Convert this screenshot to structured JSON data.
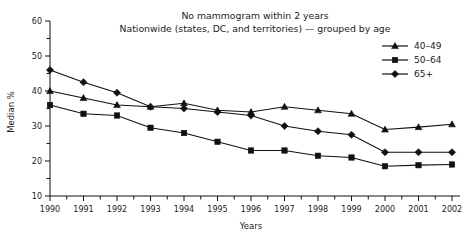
{
  "chart_data": {
    "type": "line",
    "title": "No mammogram within 2 years",
    "subtitle": "Nationwide (states, DC, and territories) — grouped by age",
    "xlabel": "Years",
    "ylabel": "Median %",
    "x": [
      1990,
      1991,
      1992,
      1993,
      1994,
      1995,
      1996,
      1997,
      1998,
      1999,
      2000,
      2001,
      2002
    ],
    "categories": [
      "1990",
      "1991",
      "1992",
      "1993",
      "1994",
      "1995",
      "1996",
      "1997",
      "1998",
      "1999",
      "2000",
      "2001",
      "2002"
    ],
    "xlim": [
      1990,
      2002
    ],
    "ylim": [
      10,
      60
    ],
    "ytick_labels": [
      "10",
      "20",
      "30",
      "40",
      "50",
      "60"
    ],
    "ytick_values": [
      10,
      20,
      30,
      40,
      50,
      60
    ],
    "yminor_values": [
      15,
      25,
      35,
      45,
      55
    ],
    "grid": false,
    "legend_position": "top-right",
    "series": [
      {
        "name": "40–49",
        "marker": "triangle",
        "color": "#111111",
        "values": [
          40.0,
          38.0,
          36.0,
          35.5,
          36.5,
          34.5,
          34.0,
          35.5,
          34.5,
          33.5,
          29.0,
          29.7,
          30.5
        ]
      },
      {
        "name": "50–64",
        "marker": "square",
        "color": "#111111",
        "values": [
          36.0,
          33.5,
          33.0,
          29.5,
          28.0,
          25.5,
          23.0,
          23.0,
          21.5,
          21.0,
          18.5,
          18.8,
          19.0
        ]
      },
      {
        "name": "65+",
        "marker": "diamond",
        "color": "#111111",
        "values": [
          46.0,
          42.5,
          39.5,
          35.5,
          35.0,
          34.0,
          33.0,
          30.0,
          28.5,
          27.5,
          22.5,
          22.5,
          22.5
        ]
      }
    ]
  },
  "legend": {
    "items": [
      {
        "label": "40–49",
        "marker": "triangle"
      },
      {
        "label": "50–64",
        "marker": "square"
      },
      {
        "label": "65+",
        "marker": "diamond"
      }
    ]
  }
}
